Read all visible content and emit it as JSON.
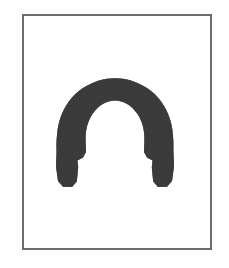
{
  "figure": {
    "title": "Retaining ring (snap ring) technical illustration",
    "caption": "",
    "object_name": "retaining-ring",
    "object_description": "Thick dark C-shaped ring open at the bottom with flared notched lug ends",
    "background_color": "#ffffff",
    "page_background_color": "#fefefe"
  },
  "frame": {
    "name": "illustration-border",
    "stroke_color": "#6d6d6d",
    "stroke_width_px": 2,
    "fill_color": "#ffffff",
    "x": 22,
    "y": 14,
    "width": 190,
    "height": 236
  },
  "shape": {
    "type": "open-ring-arc",
    "fill_color": "#3d3d3d",
    "texture": "mottled-scan-grain",
    "center_x": 115,
    "center_y": 140,
    "outer_radius": 59,
    "inner_radius": 38,
    "gap_opening": "bottom",
    "gap_angle_degrees": 55,
    "start_angle_degrees": 117,
    "end_angle_degrees": 63,
    "bounds": {
      "left": 56,
      "top": 78,
      "right": 174,
      "bottom": 187
    },
    "band_thickness_px": 21,
    "lug_flare": true,
    "lug_notch": true,
    "left_lug": {
      "x": 56,
      "y": 160,
      "width": 22,
      "height": 27
    },
    "right_lug": {
      "x": 152,
      "y": 160,
      "width": 22,
      "height": 27
    }
  },
  "labels": {
    "none_visible": ""
  }
}
